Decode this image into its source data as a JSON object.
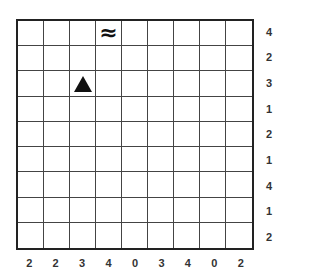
{
  "puzzle": {
    "rows": 9,
    "cols": 9,
    "symbols": [
      {
        "row": 0,
        "col": 3,
        "type": "water",
        "glyph": "≈"
      },
      {
        "row": 2,
        "col": 2,
        "type": "triangle",
        "glyph": "▲"
      }
    ],
    "right_clues": [
      "4",
      "2",
      "3",
      "1",
      "2",
      "1",
      "4",
      "1",
      "2"
    ],
    "bottom_clues": [
      "2",
      "2",
      "3",
      "4",
      "0",
      "3",
      "4",
      "0",
      "2"
    ]
  }
}
